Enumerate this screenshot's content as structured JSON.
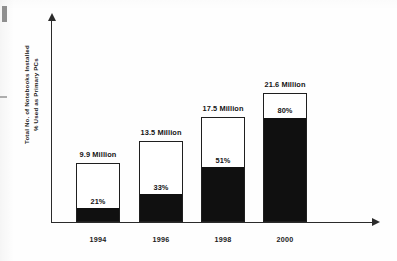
{
  "chart_data": {
    "type": "bar",
    "subtype": "stacked-bar-percentage",
    "title": "",
    "xlabel": "",
    "ylabel": "Total No. of Notebooks Installed\n% Used as Primary PCs",
    "ylabel_lines": [
      "Total No. of Notebooks Installed",
      "% Used as Primary PCs"
    ],
    "categories": [
      "1994",
      "1996",
      "1998",
      "2000"
    ],
    "series": [
      {
        "name": "Total No. of Notebooks Installed",
        "unit": "Million",
        "values": [
          9.9,
          13.5,
          17.5,
          21.6
        ],
        "labels": [
          "9.9 Million",
          "13.5 Million",
          "17.5 Million",
          "21.6 Million"
        ]
      },
      {
        "name": "% Used as Primary PCs",
        "unit": "%",
        "values": [
          21,
          33,
          51,
          80
        ],
        "labels": [
          "21%",
          "33%",
          "51%",
          "80%"
        ]
      }
    ],
    "ylim": [
      0,
      24
    ],
    "grid": false,
    "legend": null,
    "axis_ticks": false,
    "colors": {
      "bar_fill": "#101010",
      "bar_outline": "#1f1f1f",
      "bar_background": "#ffffff",
      "axis": "#2b2b2b",
      "text": "#141414",
      "page_background": "#ffffff"
    }
  },
  "bars": [
    {
      "category": "1994",
      "total_label": "9.9 Million",
      "pct_label": "21%",
      "total_value": 9.9,
      "pct_value": 21
    },
    {
      "category": "1996",
      "total_label": "13.5 Million",
      "pct_label": "33%",
      "total_value": 13.5,
      "pct_value": 33
    },
    {
      "category": "1998",
      "total_label": "17.5 Million",
      "pct_label": "51%",
      "total_value": 17.5,
      "pct_value": 51
    },
    {
      "category": "2000",
      "total_label": "21.6 Million",
      "pct_label": "80%",
      "total_value": 21.6,
      "pct_value": 80
    }
  ],
  "axis": {
    "y_title_line1": "Total No. of Notebooks Installed",
    "y_title_line2": "% Used as Primary PCs"
  }
}
